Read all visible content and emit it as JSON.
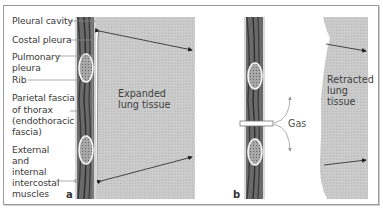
{
  "figure": {
    "panels": [
      {
        "id": "a",
        "letter": "a",
        "lung_label": [
          "Expanded",
          "lung tissue"
        ],
        "state": "expanded"
      },
      {
        "id": "b",
        "letter": "b",
        "lung_label": [
          "Retracted",
          "lung",
          "tissue"
        ],
        "gas_label": "Gas",
        "state": "retracted"
      }
    ],
    "labels": [
      {
        "lines": [
          "Pleural cavity"
        ]
      },
      {
        "lines": [
          "Costal pleura"
        ]
      },
      {
        "lines": [
          "Pulmonary",
          "pleura"
        ]
      },
      {
        "lines": [
          "Rib"
        ]
      },
      {
        "lines": [
          "Parietal fascia",
          "of thorax",
          "(endothoracic",
          "fascia)"
        ]
      },
      {
        "lines": [
          "External",
          "and",
          "internal",
          "intercostal",
          "muscles"
        ]
      }
    ],
    "colors": {
      "lung_gray": "#c8c8c8",
      "muscle_dark": "#555555",
      "muscle_mid": "#7a7a7a",
      "rib_fill": "#9a9a9a",
      "leader_line": "#8a8a8a",
      "arrow": "#222222",
      "gas_arrow": "#9a9a9a"
    }
  }
}
